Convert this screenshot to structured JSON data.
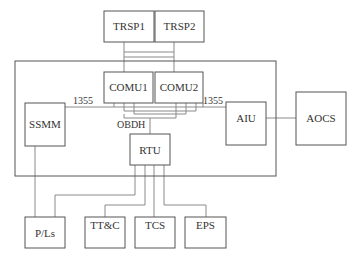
{
  "diagram": {
    "type": "block-diagram",
    "nodes": {
      "trsp1": "TRSP1",
      "trsp2": "TRSP2",
      "comu1": "COMU1",
      "comu2": "COMU2",
      "ssmm": "SSMM",
      "aiu": "AIU",
      "aocs": "AOCS",
      "rtu": "RTU",
      "pls": "P/Ls",
      "ttc": "TT&C",
      "tcs": "TCS",
      "eps": "EPS"
    },
    "labels": {
      "bus_left": "1355",
      "bus_right": "1355",
      "obdh": "OBDH"
    },
    "edges": [
      [
        "TRSP1",
        "COMU1"
      ],
      [
        "TRSP1",
        "COMU2"
      ],
      [
        "TRSP2",
        "COMU1"
      ],
      [
        "TRSP2",
        "COMU2"
      ],
      [
        "SSMM",
        "COMU1",
        "1355"
      ],
      [
        "SSMM",
        "COMU2",
        "1355"
      ],
      [
        "AIU",
        "COMU1",
        "1355"
      ],
      [
        "AIU",
        "COMU2",
        "1355"
      ],
      [
        "COMU1",
        "RTU",
        "OBDH"
      ],
      [
        "COMU2",
        "RTU",
        "OBDH"
      ],
      [
        "AIU",
        "AOCS"
      ],
      [
        "SSMM",
        "P/Ls"
      ],
      [
        "RTU",
        "P/Ls"
      ],
      [
        "RTU",
        "TT&C"
      ],
      [
        "RTU",
        "TCS"
      ],
      [
        "RTU",
        "EPS"
      ]
    ]
  }
}
